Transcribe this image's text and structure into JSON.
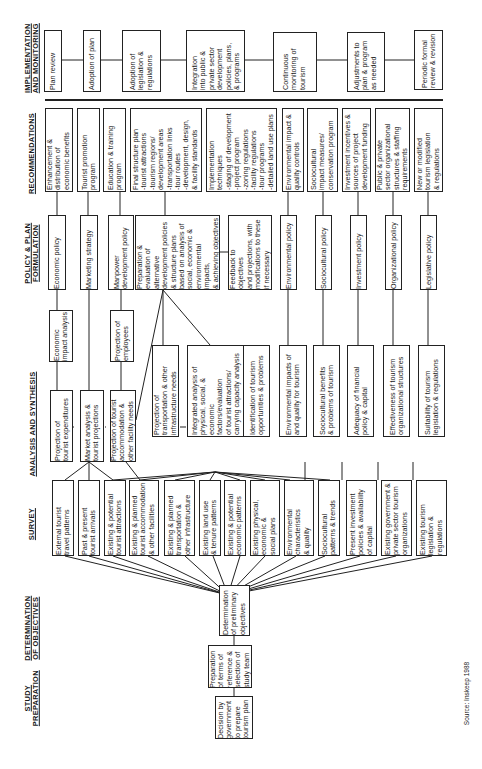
{
  "stages": {
    "implementation": "IMPLEMENTATION\nAND MONITORING",
    "recommendations": "RECOMMENDATIONS",
    "policy": "POLICY & PLAN\nFORMULATION",
    "analysis": "ANALYSIS AND SYNTHESIS",
    "survey": "SURVEY",
    "objectives": "DETERMINATION\nOF OBJECTIVES",
    "preparation": "STUDY\nPREPARATION"
  },
  "implementation": [
    "Plan review",
    "Adoption of plan",
    "Adoption of\nlegislation &\nregulations",
    "Integration\ninto public &\nprivate sector\ndevelopment\npolicies, plans,\n& programs",
    "Continuous\nmonitoring of\ntourism",
    "Adjustments to\nplan & program\nas needed",
    "Periodic formal\nreview & revision"
  ],
  "recommendations": [
    "Enhancement &\ndistribution of\neconomic benefits",
    "Tourist promotion\nprogram",
    "Education & training\nprogram",
    "Final structure plan\n-tourist attractions\n-tourism regions/\n  development areas\n-transportation links\n-tour routes\n-development, design,\n  & facility standards",
    "Implementation\ntechniques\n-staging of development\n-project program\n-zoning regulations\n-facility regulations\n-tour programs\n-detailed land use plans",
    "Environmental impact &\nquality controls",
    "Sociocultural\nimpact measures/\nconservation program",
    "Investment incentives &\nsources of project\ndevelopment funding",
    "Public & private\nsector organizational\nstructures & staffing\nrequirements",
    "New or modified\ntourism legislation\n& regulations"
  ],
  "policy": [
    "Economic policy",
    "Marketing strategy",
    "Manpower\ndevelopment policy",
    "Preparation &\nevaluation of\nalternative\ndevelopment policies\n& structure plans\nbased on analysis of\nsocial, economic &\nenvironmental impacts,\n& achieving objectives",
    "Feedback to objectives\nand projections, with\nmodifications to these\nif necessary",
    "Environmental policy",
    "Sociocultural policy",
    "Investment policy",
    "Organizational policy",
    "Legislative policy"
  ],
  "analysis": [
    "Economic\nimpact analysis",
    "Projection of\nemployees",
    "Projection of\ntourist expenditures",
    "Market analysis &\ntourist projections",
    "Projection of tourist\naccommodation &\nother facility needs",
    "Projection of\ntransportation & other\ninfrastructure needs",
    "Integrated analysis of\nphysical, social, &\neconomic factors/evaluation\nof tourist attractions/\ncarrying capacity analysis",
    "Identification of tourism\nopportunities & problems",
    "Environmental impacts of\nand quality for tourism",
    "Sociocultural benefits\n& problems of tourism",
    "Adequacy of financial\npolicy & capital",
    "Effectiveness of tourism\norganizational structures",
    "Suitability of tourism\nlegislation & regulations"
  ],
  "survey": [
    "External tourist\ntravel patterns",
    "Past & present\ntourist arrivals",
    "Existing & potential\ntourist attractions",
    "Existing & planned\ntourist accommodation\n& other facilities",
    "Existing & planned\ntransportation &\nother infrastructure",
    "Existing land use\n& tenure patterns",
    "Existing & potential\neconomic patterns",
    "Existing physical,\neconomic &\nsocial plans",
    "Environmental\ncharacteristics\n& quality",
    "Sociocultural\npatterns & trends",
    "Present investment\npolicies & availability\nof capital",
    "Existing government &\nprivate sector tourism\norganizations",
    "Existing tourism\nlegislation &\nregulations"
  ],
  "objectives": [
    "Determination\nof preliminary\nobjectives"
  ],
  "preparation": [
    "Preparation\nof terms of\nreference &\nselection of\nstudy team",
    "Decision by\ngovernment\nto prepare\ntourism plan"
  ],
  "source": "Source: Inskeep 1988"
}
